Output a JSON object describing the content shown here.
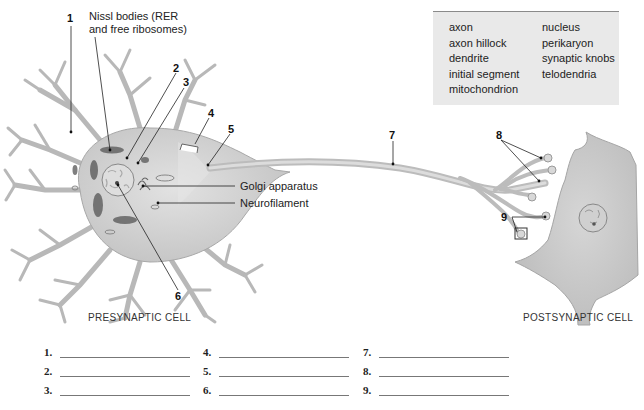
{
  "word_bank": {
    "column1": [
      "axon",
      "axon hillock",
      "dendrite",
      "initial segment",
      "mitochondrion"
    ],
    "column2": [
      "nucleus",
      "perikaryon",
      "synaptic knobs",
      "telodendria"
    ]
  },
  "labels": {
    "nissl": "Nissl bodies (RER\nand free ribosomes)",
    "nissl_line1": "Nissl bodies (RER",
    "nissl_line2": "and free ribosomes)",
    "golgi": "Golgi apparatus",
    "neurofilament": "Neurofilament"
  },
  "numbers": {
    "n1": "1",
    "n2": "2",
    "n3": "3",
    "n4": "4",
    "n5": "5",
    "n6": "6",
    "n7": "7",
    "n8": "8",
    "n9": "9"
  },
  "cell_titles": {
    "presynaptic": "PRESYNAPTIC CELL",
    "postsynaptic": "POSTSYNAPTIC CELL"
  },
  "answers": [
    {
      "label": "1.",
      "value": ""
    },
    {
      "label": "2.",
      "value": ""
    },
    {
      "label": "3.",
      "value": ""
    },
    {
      "label": "4.",
      "value": ""
    },
    {
      "label": "5.",
      "value": ""
    },
    {
      "label": "6.",
      "value": ""
    },
    {
      "label": "7.",
      "value": ""
    },
    {
      "label": "8.",
      "value": ""
    },
    {
      "label": "9.",
      "value": ""
    }
  ],
  "colors": {
    "cell_fill": "#d4d4d4",
    "cell_stroke": "#9a9a9a",
    "wordbank_bg": "#e9e9e9",
    "leader_line": "#222222"
  }
}
